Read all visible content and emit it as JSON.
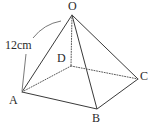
{
  "figure": {
    "type": "square-pyramid-diagram",
    "background_color": "#ffffff",
    "stroke_color": "#3a3a3a",
    "label_color": "#2b2b2b",
    "labels": {
      "apex": "O",
      "front_left": "A",
      "front_bottom": "B",
      "right": "C",
      "hidden_back": "D"
    },
    "annotation": {
      "measure": "12cm",
      "describes": "edge OA",
      "leader_style": "curved-arc-plus-straight-line"
    },
    "vertices": {
      "O": {
        "x": 72,
        "y": 15
      },
      "A": {
        "x": 22,
        "y": 92
      },
      "B": {
        "x": 97,
        "y": 109
      },
      "C": {
        "x": 138,
        "y": 79
      },
      "D": {
        "x": 71,
        "y": 66
      }
    },
    "edges": [
      {
        "from": "O",
        "to": "A",
        "style": "solid"
      },
      {
        "from": "O",
        "to": "B",
        "style": "solid"
      },
      {
        "from": "O",
        "to": "C",
        "style": "solid"
      },
      {
        "from": "O",
        "to": "D",
        "style": "dotted"
      },
      {
        "from": "A",
        "to": "B",
        "style": "solid"
      },
      {
        "from": "B",
        "to": "C",
        "style": "solid"
      },
      {
        "from": "A",
        "to": "D",
        "style": "dotted"
      },
      {
        "from": "D",
        "to": "C",
        "style": "dotted"
      }
    ]
  }
}
